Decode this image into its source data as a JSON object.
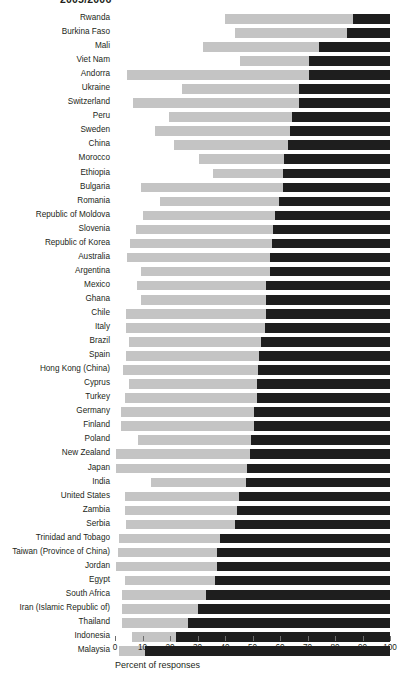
{
  "chart_data": {
    "type": "bar",
    "orientation": "horizontal",
    "stacked": true,
    "title": "2005/2006",
    "xlabel": "Percent of responses",
    "ylabel": "",
    "xlim": [
      0,
      100
    ],
    "xticks": [
      0,
      10,
      20,
      30,
      40,
      50,
      60,
      70,
      80,
      90,
      100
    ],
    "xtick_labels": [
      "0",
      "10",
      "20",
      "30",
      "40",
      "50",
      "60",
      "70",
      "80",
      "90",
      "100"
    ],
    "grid": false,
    "legend": "none",
    "colors": {
      "light_segment": "#c4c4c4",
      "dark_segment": "#1e1e1e",
      "background": "#ffffff",
      "text": "#231f20",
      "tick": "#6d6d6d"
    },
    "series": [
      {
        "name": "segment-light",
        "color": "#c4c4c4"
      },
      {
        "name": "segment-dark",
        "color": "#1e1e1e"
      }
    ],
    "categories": [
      "Rwanda",
      "Burkina Faso",
      "Mali",
      "Viet Nam",
      "Andorra",
      "Ukraine",
      "Switzerland",
      "Peru",
      "Sweden",
      "China",
      "Morocco",
      "Ethiopia",
      "Bulgaria",
      "Romania",
      "Republic of Moldova",
      "Slovenia",
      "Republic of Korea",
      "Australia",
      "Argentina",
      "Mexico",
      "Ghana",
      "Chile",
      "Italy",
      "Brazil",
      "Spain",
      "Hong Kong (China)",
      "Cyprus",
      "Turkey",
      "Germany",
      "Finland",
      "Poland",
      "New Zealand",
      "Japan",
      "India",
      "United States",
      "Zambia",
      "Serbia",
      "Trinidad and Tobago",
      "Taiwan (Province of China)",
      "Jordan",
      "Egypt",
      "South Africa",
      "Iran (Islamic Republic of)",
      "Thailand",
      "Indonesia",
      "Malaysia"
    ],
    "rows": [
      {
        "label": "Rwanda",
        "start": 40.0,
        "split": 86.5,
        "end": 100
      },
      {
        "label": "Burkina Faso",
        "start": 43.5,
        "split": 84.5,
        "end": 100
      },
      {
        "label": "Mali",
        "start": 32.0,
        "split": 74.0,
        "end": 100
      },
      {
        "label": "Viet Nam",
        "start": 45.5,
        "split": 70.5,
        "end": 100
      },
      {
        "label": "Andorra",
        "start": 4.5,
        "split": 70.5,
        "end": 100
      },
      {
        "label": "Ukraine",
        "start": 24.5,
        "split": 67.0,
        "end": 100
      },
      {
        "label": "Switzerland",
        "start": 6.5,
        "split": 67.0,
        "end": 100
      },
      {
        "label": "Peru",
        "start": 19.5,
        "split": 64.5,
        "end": 100
      },
      {
        "label": "Sweden",
        "start": 14.5,
        "split": 63.5,
        "end": 100
      },
      {
        "label": "China",
        "start": 21.5,
        "split": 63.0,
        "end": 100
      },
      {
        "label": "Morocco",
        "start": 30.5,
        "split": 61.5,
        "end": 100
      },
      {
        "label": "Ethiopia",
        "start": 35.5,
        "split": 61.0,
        "end": 100
      },
      {
        "label": "Bulgaria",
        "start": 9.5,
        "split": 61.0,
        "end": 100
      },
      {
        "label": "Romania",
        "start": 16.5,
        "split": 59.5,
        "end": 100
      },
      {
        "label": "Republic of Moldova",
        "start": 10.0,
        "split": 58.0,
        "end": 100
      },
      {
        "label": "Slovenia",
        "start": 7.5,
        "split": 57.5,
        "end": 100
      },
      {
        "label": "Republic of Korea",
        "start": 5.5,
        "split": 57.0,
        "end": 100
      },
      {
        "label": "Australia",
        "start": 4.5,
        "split": 56.5,
        "end": 100
      },
      {
        "label": "Argentina",
        "start": 9.5,
        "split": 56.5,
        "end": 100
      },
      {
        "label": "Mexico",
        "start": 8.0,
        "split": 55.0,
        "end": 100
      },
      {
        "label": "Ghana",
        "start": 9.5,
        "split": 55.0,
        "end": 100
      },
      {
        "label": "Chile",
        "start": 4.0,
        "split": 55.0,
        "end": 100
      },
      {
        "label": "Italy",
        "start": 4.0,
        "split": 54.5,
        "end": 100
      },
      {
        "label": "Brazil",
        "start": 5.0,
        "split": 53.0,
        "end": 100
      },
      {
        "label": "Spain",
        "start": 4.0,
        "split": 52.5,
        "end": 100
      },
      {
        "label": "Hong Kong (China)",
        "start": 3.0,
        "split": 52.0,
        "end": 100
      },
      {
        "label": "Cyprus",
        "start": 5.0,
        "split": 51.5,
        "end": 100
      },
      {
        "label": "Turkey",
        "start": 3.5,
        "split": 51.5,
        "end": 100
      },
      {
        "label": "Germany",
        "start": 2.0,
        "split": 50.5,
        "end": 100
      },
      {
        "label": "Finland",
        "start": 2.0,
        "split": 50.5,
        "end": 100
      },
      {
        "label": "Poland",
        "start": 8.5,
        "split": 49.5,
        "end": 100
      },
      {
        "label": "New Zealand",
        "start": 0.5,
        "split": 49.0,
        "end": 100
      },
      {
        "label": "Japan",
        "start": 0.5,
        "split": 48.0,
        "end": 100
      },
      {
        "label": "India",
        "start": 13.0,
        "split": 47.5,
        "end": 100
      },
      {
        "label": "United States",
        "start": 3.5,
        "split": 45.0,
        "end": 100
      },
      {
        "label": "Zambia",
        "start": 3.5,
        "split": 44.5,
        "end": 100
      },
      {
        "label": "Serbia",
        "start": 4.0,
        "split": 43.5,
        "end": 100
      },
      {
        "label": "Trinidad and Tobago",
        "start": 1.5,
        "split": 38.0,
        "end": 100
      },
      {
        "label": "Taiwan (Province of China)",
        "start": 1.0,
        "split": 37.0,
        "end": 100
      },
      {
        "label": "Jordan",
        "start": 0.5,
        "split": 37.0,
        "end": 100
      },
      {
        "label": "Egypt",
        "start": 3.5,
        "split": 36.5,
        "end": 100
      },
      {
        "label": "South Africa",
        "start": 2.5,
        "split": 33.0,
        "end": 100
      },
      {
        "label": "Iran (Islamic Republic of)",
        "start": 2.5,
        "split": 30.0,
        "end": 100
      },
      {
        "label": "Thailand",
        "start": 2.5,
        "split": 26.5,
        "end": 100
      },
      {
        "label": "Indonesia",
        "start": 6.0,
        "split": 22.0,
        "end": 100
      },
      {
        "label": "Malaysia",
        "start": 1.5,
        "split": 11.0,
        "end": 100
      }
    ]
  }
}
